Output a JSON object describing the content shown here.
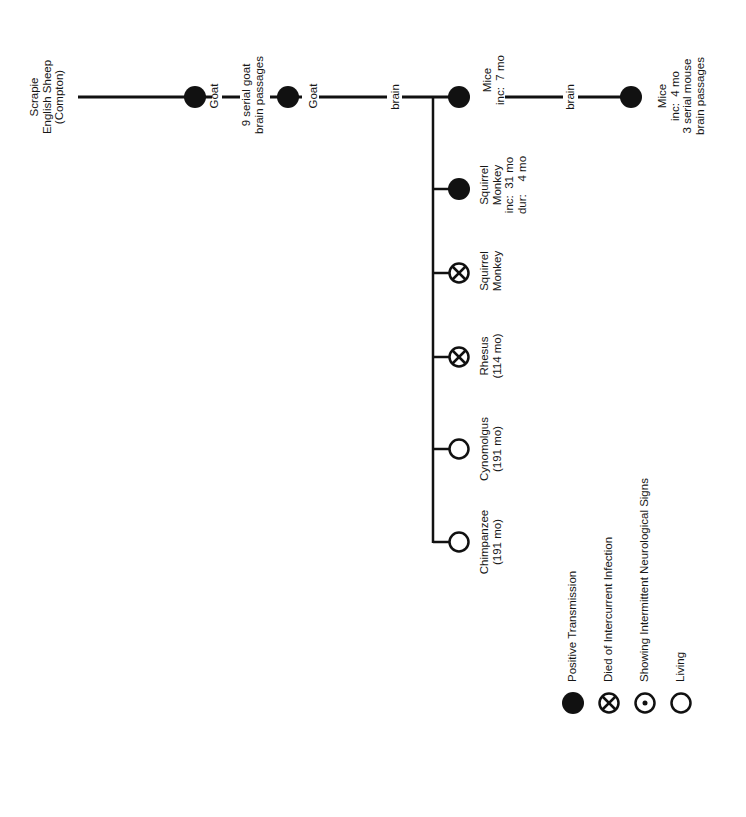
{
  "diagram": {
    "orientation": "rotated-90-ccw",
    "colors": {
      "ink": "#111111",
      "background": "#ffffff"
    },
    "source": {
      "label_lines": [
        "Scrapie",
        "English Sheep",
        "(Compton)"
      ]
    },
    "chain": [
      {
        "id": "goat-1",
        "status": "positive-transmission",
        "label_lines": [
          "Goat"
        ]
      },
      {
        "id": "goat-passages",
        "label_lines": [
          "9 serial goat",
          "brain passages"
        ]
      },
      {
        "id": "goat-2",
        "status": "positive-transmission",
        "label_lines": [
          "Goat"
        ]
      },
      {
        "id": "route-1",
        "label_lines": [
          "brain"
        ]
      },
      {
        "id": "mice-1",
        "status": "positive-transmission",
        "label_lines": [
          "Mice",
          "inc:  7 mo"
        ]
      },
      {
        "id": "route-2",
        "label_lines": [
          "brain"
        ]
      },
      {
        "id": "mice-2",
        "status": "positive-transmission",
        "label_lines": [
          "Mice",
          "inc:  4 mo",
          "3 serial mouse",
          "brain passages"
        ]
      }
    ],
    "branches": [
      {
        "id": "squirrel-monkey-1",
        "status": "positive-transmission",
        "label_lines": [
          "Squirrel",
          "Monkey",
          "inc:  31 mo",
          "dur:    4 mo"
        ]
      },
      {
        "id": "squirrel-monkey-2",
        "status": "died-of-intercurrent-infection",
        "label_lines": [
          "Squirrel",
          "Monkey"
        ]
      },
      {
        "id": "rhesus",
        "status": "died-of-intercurrent-infection",
        "label_lines": [
          "Rhesus",
          "(114 mo)"
        ]
      },
      {
        "id": "cynomolgus",
        "status": "living",
        "label_lines": [
          "Cynomolgus",
          "(191 mo)"
        ]
      },
      {
        "id": "chimpanzee",
        "status": "living",
        "label_lines": [
          "Chimpanzee",
          "(191 mo)"
        ]
      }
    ],
    "legend": [
      {
        "status": "positive-transmission",
        "label": "Positive Transmission"
      },
      {
        "status": "died-of-intercurrent-infection",
        "label": "Died of Intercurrent Infection"
      },
      {
        "status": "showing-intermittent-neurological-signs",
        "label": "Showing Intermittent Neurological Signs"
      },
      {
        "status": "living",
        "label": "Living"
      }
    ]
  },
  "text": {
    "source": "Scrapie\nEnglish Sheep\n(Compton)",
    "goat1": "Goat",
    "goat_passages": "9 serial goat\nbrain passages",
    "goat2": "Goat",
    "brain1": "brain",
    "mice1": "Mice\ninc:  7 mo",
    "brain2": "brain",
    "mice2": "Mice\ninc:  4 mo\n3 serial mouse\nbrain passages",
    "sq1": "Squirrel\nMonkey\ninc:  31 mo\ndur:    4 mo",
    "sq2": "Squirrel\nMonkey",
    "rhesus": "Rhesus\n(114 mo)",
    "cyno": "Cynomolgus\n(191 mo)",
    "chimp": "Chimpanzee\n(191 mo)",
    "legend_positive": "Positive Transmission",
    "legend_died": "Died of Intercurrent Infection",
    "legend_signs": "Showing Intermittent Neurological Signs",
    "legend_living": "Living"
  }
}
